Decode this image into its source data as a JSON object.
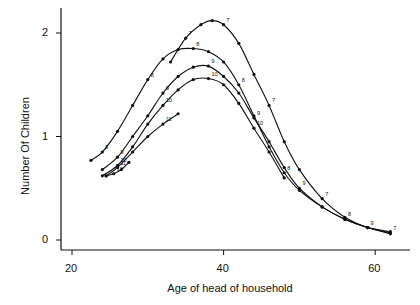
{
  "chart_data": {
    "type": "line",
    "title": "",
    "xlabel": "Age of head of household",
    "ylabel": "Number Of Children",
    "xlim": [
      18,
      64
    ],
    "ylim": [
      -0.05,
      2.25
    ],
    "xticks": [
      20,
      40,
      60
    ],
    "yticks": [
      0,
      1,
      2
    ],
    "xtick_labels": [
      "20",
      "40",
      "60"
    ],
    "ytick_labels": [
      "0",
      "1",
      "2"
    ],
    "grid": false,
    "legend": null,
    "annotations": "Curves are labeled along their length with small cohort numbers (7, 8, 9, 10, 11, 12) and dot markers at data points",
    "series": [
      {
        "name": "7",
        "x": [
          33,
          35,
          37,
          38.5,
          40,
          42,
          44,
          46,
          48,
          50,
          53,
          56,
          59,
          62
        ],
        "y": [
          1.72,
          1.95,
          2.08,
          2.12,
          2.08,
          1.9,
          1.6,
          1.3,
          0.95,
          0.68,
          0.4,
          0.22,
          0.12,
          0.07
        ]
      },
      {
        "name": "8",
        "x": [
          22.5,
          24,
          26,
          28,
          30,
          32,
          34,
          36,
          38,
          40,
          42,
          44,
          46,
          48,
          50,
          53,
          56,
          59,
          62
        ],
        "y": [
          0.77,
          0.85,
          1.05,
          1.3,
          1.55,
          1.75,
          1.84,
          1.85,
          1.82,
          1.72,
          1.5,
          1.2,
          0.9,
          0.65,
          0.48,
          0.32,
          0.2,
          0.12,
          0.08
        ]
      },
      {
        "name": "9",
        "x": [
          24,
          26,
          28,
          30,
          32,
          34,
          36,
          38,
          40,
          42,
          44,
          46,
          48,
          50,
          53,
          56,
          59,
          62
        ],
        "y": [
          0.68,
          0.8,
          1.0,
          1.2,
          1.42,
          1.58,
          1.67,
          1.68,
          1.58,
          1.42,
          1.18,
          0.95,
          0.7,
          0.5,
          0.32,
          0.2,
          0.12,
          0.06
        ]
      },
      {
        "name": "10",
        "x": [
          24,
          26,
          28,
          30,
          32,
          34,
          36,
          38,
          40,
          42,
          44,
          46,
          48
        ],
        "y": [
          0.62,
          0.72,
          0.9,
          1.12,
          1.3,
          1.45,
          1.55,
          1.56,
          1.5,
          1.32,
          1.08,
          0.85,
          0.6
        ]
      },
      {
        "name": "11",
        "x": [
          24.5,
          26,
          28,
          30,
          32,
          34
        ],
        "y": [
          0.62,
          0.7,
          0.85,
          1.0,
          1.12,
          1.22
        ]
      },
      {
        "name": "12",
        "x": [
          24.5,
          25.5,
          26.5,
          27.5
        ],
        "y": [
          0.62,
          0.64,
          0.68,
          0.75
        ]
      }
    ]
  }
}
